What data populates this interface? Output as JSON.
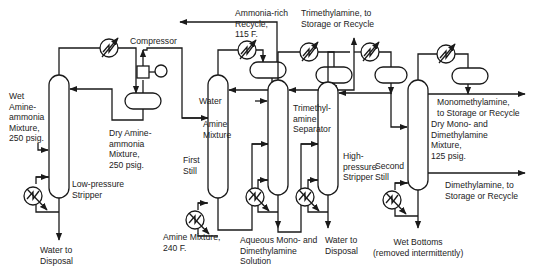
{
  "diagram": {
    "type": "process-flow",
    "units": {
      "low_pressure_stripper": "Low-pressure\nStripper",
      "compressor": "Compressor",
      "first_still": "First\nStill",
      "trimethylamine_separator": "Trimethyl-\namine\nSeparator",
      "high_pressure_stripper": "High-\npressure\nStripper",
      "second_still": "Second\nStill"
    },
    "streams": {
      "feed": "Wet\nAmine-\nammonia\nMixture,\n250 psig.",
      "dry_amine_ammonia": "Dry Amine-\nammonia\nMixture,\n250 psig.",
      "water_disposal_1": "Water to\nDisposal",
      "ammonia_recycle": "Ammonia-rich\nRecycle,\n115 F.",
      "water_in": "Water",
      "amine_mixture": "Amine\nMixture",
      "amine_mixture_240": "Amine Mixture,\n240 F.",
      "trimethylamine_out": "Trimethylamine, to\nStorage or Recycle",
      "aqueous_solution": "Aqueous Mono- and\nDimethylamine\nSolution",
      "water_disposal_2": "Water to\nDisposal",
      "monomethylamine_out": "Monomethylamine,\nto Storage or Recycle",
      "dry_mono_di": "Dry Mono- and\nDimethylamine\nMixture,\n125 psig.",
      "dimethylamine_out": "Dimethylamine, to\nStorage or Recycle",
      "wet_bottoms": "Wet Bottoms\n(removed intermittently)"
    }
  }
}
